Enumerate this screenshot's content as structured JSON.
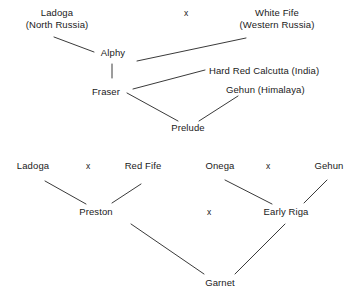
{
  "diagram": {
    "line_color": "#3a3a3a",
    "text_color": "#1a1a1a",
    "cross_symbol": "x",
    "pedigrees": [
      {
        "id": "prelude-pedigree",
        "nodes": [
          {
            "id": "ladoga-top",
            "line1": "Ladoga",
            "line2": "(North Russia)"
          },
          {
            "id": "white-fife",
            "line1": "White Fife",
            "line2": "(Western Russia)"
          },
          {
            "id": "alphy",
            "line1": "Alphy",
            "line2": ""
          },
          {
            "id": "hard-red-calcutta",
            "line1": "Hard Red Calcutta (India)",
            "line2": ""
          },
          {
            "id": "fraser",
            "line1": "Fraser",
            "line2": ""
          },
          {
            "id": "gehun-himalaya",
            "line1": "Gehun (Himalaya)",
            "line2": ""
          },
          {
            "id": "prelude",
            "line1": "Prelude",
            "line2": ""
          }
        ],
        "crosses": [
          {
            "id": "cross-ladoga-whitefife",
            "label": "x"
          }
        ]
      },
      {
        "id": "garnet-pedigree",
        "nodes": [
          {
            "id": "ladoga-bottom",
            "line1": "Ladoga",
            "line2": ""
          },
          {
            "id": "red-fife",
            "line1": "Red Fife",
            "line2": ""
          },
          {
            "id": "onega",
            "line1": "Onega",
            "line2": ""
          },
          {
            "id": "gehun",
            "line1": "Gehun",
            "line2": ""
          },
          {
            "id": "preston",
            "line1": "Preston",
            "line2": ""
          },
          {
            "id": "early-riga",
            "line1": "Early Riga",
            "line2": ""
          },
          {
            "id": "garnet",
            "line1": "Garnet",
            "line2": ""
          }
        ],
        "crosses": [
          {
            "id": "cross-ladoga-redfife",
            "label": "x"
          },
          {
            "id": "cross-onega-gehun",
            "label": "x"
          },
          {
            "id": "cross-preston-earlyriga",
            "label": "x"
          }
        ]
      }
    ]
  }
}
